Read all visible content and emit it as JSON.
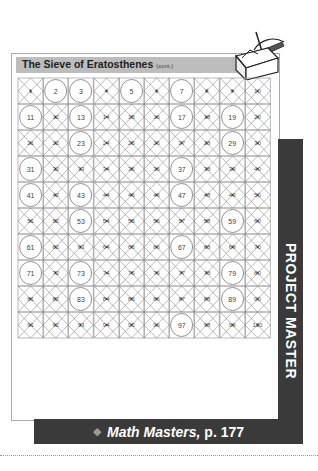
{
  "header": {
    "title": "The Sieve of Eratosthenes",
    "subtitle": "(cont.)"
  },
  "side_tab": {
    "label": "PROJECT MASTER"
  },
  "footer_banner": {
    "icon": "diamond-icon",
    "title": "Math Masters,",
    "page": "p. 177"
  },
  "decor": {
    "toolbox_icon": "toolbox-with-tools-icon"
  },
  "sieve": {
    "rows": 10,
    "cols": 10,
    "start": 1,
    "end": 100,
    "circled_primes": [
      2,
      3,
      5,
      7,
      11,
      13,
      17,
      19,
      23,
      29,
      31,
      37,
      41,
      43,
      47,
      53,
      59,
      61,
      67,
      71,
      73,
      79,
      83,
      89,
      97
    ],
    "crossed_rule": "1 and all composite numbers are crossed out",
    "colors": {
      "line": "#8a8a8a",
      "circle": "#777777",
      "text": "#444444"
    }
  },
  "cells": []
}
